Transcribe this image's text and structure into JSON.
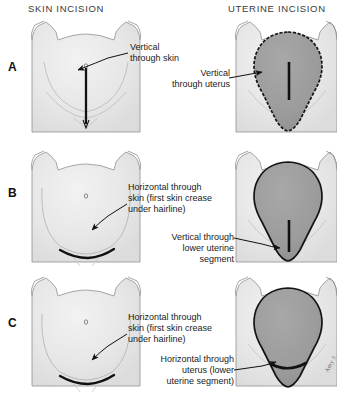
{
  "headers": {
    "skin": "SKIN INCISION",
    "uterine": "UTERINE INCISION"
  },
  "panels": [
    {
      "letter": "A",
      "skin_label": "Vertical\nthrough skin",
      "uterus_label": "Vertical\nthrough uterus",
      "skin_incision_type": "vertical",
      "uterus_incision_type": "vertical"
    },
    {
      "letter": "B",
      "skin_label": "Horizontal through\nskin (first skin crease\nunder hairline)",
      "uterus_label": "Vertical through\nlower uterine\nsegment",
      "skin_incision_type": "horizontal",
      "uterus_incision_type": "vertical-lower"
    },
    {
      "letter": "C",
      "skin_label": "Horizontal through\nskin (first skin crease\nunder hairline)",
      "uterus_label": "Horizontal through\nuterus (lower\nuterine segment)",
      "skin_incision_type": "horizontal",
      "uterus_incision_type": "horizontal-lower"
    }
  ],
  "signature": "Amy J.",
  "colors": {
    "background": "#ffffff",
    "abdomen_fill": "#e9e9e9",
    "abdomen_outline": "#8a8a8a",
    "uterus_fill": "#9c9c9c",
    "uterus_outline": "#1a1a1a",
    "incision_line": "#111111",
    "text": "#1a1a1a",
    "header_text": "#3a3a3a"
  }
}
